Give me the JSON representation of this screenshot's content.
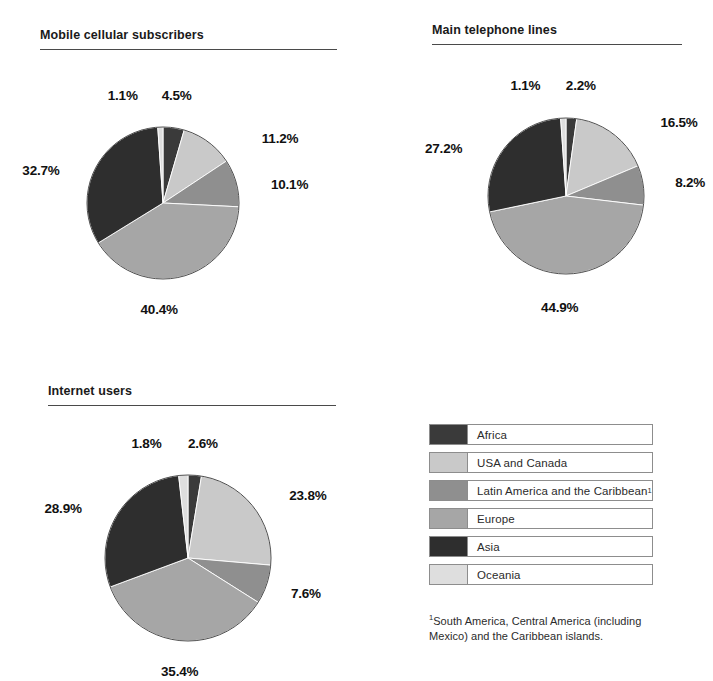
{
  "legend": {
    "items": [
      {
        "label": "Africa",
        "key": "africa",
        "color": "#3a3a3a",
        "footnote_marker": ""
      },
      {
        "label": "USA and Canada",
        "key": "usa_canada",
        "color": "#c9c9c9",
        "footnote_marker": ""
      },
      {
        "label": "Latin America and the Caribbean",
        "key": "latin_america",
        "color": "#8f8f8f",
        "footnote_marker": "1"
      },
      {
        "label": "Europe",
        "key": "europe",
        "color": "#a6a6a6",
        "footnote_marker": ""
      },
      {
        "label": "Asia",
        "key": "asia",
        "color": "#2e2e2e",
        "footnote_marker": ""
      },
      {
        "label": "Oceania",
        "key": "oceania",
        "color": "#dedede",
        "footnote_marker": ""
      }
    ]
  },
  "footnote": {
    "marker": "1",
    "text": "South America, Central America (including Mexico) and the Caribbean islands."
  },
  "chart_data": [
    {
      "type": "pie",
      "title": "Mobile cellular subscribers",
      "categories": [
        "Africa",
        "USA and Canada",
        "Latin America and the Caribbean",
        "Europe",
        "Asia",
        "Oceania"
      ],
      "values": [
        4.5,
        11.2,
        10.1,
        40.4,
        32.7,
        1.1
      ],
      "labels": [
        "4.5%",
        "11.2%",
        "10.1%",
        "40.4%",
        "32.7%",
        "1.1%"
      ],
      "colors": [
        "#3a3a3a",
        "#c9c9c9",
        "#8f8f8f",
        "#a6a6a6",
        "#2e2e2e",
        "#dedede"
      ],
      "units": "percent",
      "start_angle": 0,
      "direction": "clockwise",
      "legend_position": "shared-bottom-right"
    },
    {
      "type": "pie",
      "title": "Main telephone lines",
      "categories": [
        "Africa",
        "USA and Canada",
        "Latin America and the Caribbean",
        "Europe",
        "Asia",
        "Oceania"
      ],
      "values": [
        2.2,
        16.5,
        8.2,
        44.9,
        27.2,
        1.1
      ],
      "labels": [
        "2.2%",
        "16.5%",
        "8.2%",
        "44.9%",
        "27.2%",
        "1.1%"
      ],
      "colors": [
        "#3a3a3a",
        "#c9c9c9",
        "#8f8f8f",
        "#a6a6a6",
        "#2e2e2e",
        "#dedede"
      ],
      "units": "percent",
      "start_angle": 0,
      "direction": "clockwise",
      "legend_position": "shared-bottom-right"
    },
    {
      "type": "pie",
      "title": "Internet users",
      "categories": [
        "Africa",
        "USA and Canada",
        "Latin America and the Caribbean",
        "Europe",
        "Asia",
        "Oceania"
      ],
      "values": [
        2.6,
        23.8,
        7.6,
        35.4,
        28.9,
        1.8
      ],
      "labels": [
        "2.6%",
        "23.8%",
        "7.6%",
        "35.4%",
        "28.9%",
        "1.8%"
      ],
      "colors": [
        "#3a3a3a",
        "#c9c9c9",
        "#8f8f8f",
        "#a6a6a6",
        "#2e2e2e",
        "#dedede"
      ],
      "units": "percent",
      "start_angle": 0,
      "direction": "clockwise",
      "legend_position": "shared-bottom-right"
    }
  ],
  "charts_geometry": [
    {
      "cx": 163,
      "cy": 203,
      "r": 76
    },
    {
      "cx": 566,
      "cy": 196,
      "r": 78
    },
    {
      "cx": 188,
      "cy": 558,
      "r": 83
    }
  ]
}
